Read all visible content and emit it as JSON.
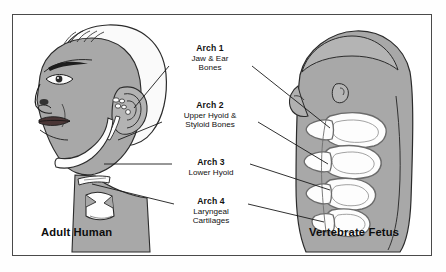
{
  "figure": {
    "border_color": "#4a4a4a",
    "background": "#ffffff",
    "skin_gray": "#a8a8a8",
    "bone_white": "#fdfdfd",
    "outline": "#2b2b2b",
    "leader_line_color": "#1a1a1a"
  },
  "labels": [
    {
      "id": "arch-1",
      "title": "Arch 1",
      "desc_lines": [
        "Jaw & Ear",
        "Bones"
      ]
    },
    {
      "id": "arch-2",
      "title": "Arch 2",
      "desc_lines": [
        "Upper Hyoid &",
        "Styloid Bones"
      ]
    },
    {
      "id": "arch-3",
      "title": "Arch 3",
      "desc_lines": [
        "Lower Hyoid"
      ]
    },
    {
      "id": "arch-4",
      "title": "Arch 4",
      "desc_lines": [
        "Laryngeal",
        "Cartilages"
      ]
    }
  ],
  "captions": {
    "left": "Adult Human",
    "right": "Vertebrate Fetus"
  },
  "panels": {
    "left_subject": "adult-human-head-profile",
    "right_subject": "vertebrate-fetus-pharyngeal-arches"
  }
}
